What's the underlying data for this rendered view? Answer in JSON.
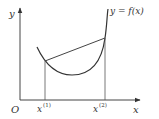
{
  "diagram": {
    "axes": {
      "x_label": "x",
      "y_label": "y",
      "origin_label": "O"
    },
    "curve_label": "y = f(x)",
    "points": [
      {
        "label": "x",
        "superscript": "(1)"
      },
      {
        "label": "x",
        "superscript": "(2)"
      }
    ],
    "colors": {
      "line": "#444444",
      "text": "#333333",
      "background": "#ffffff"
    }
  }
}
